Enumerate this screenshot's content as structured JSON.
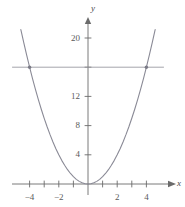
{
  "chart_data": {
    "type": "line",
    "title": "",
    "xlabel": "x",
    "ylabel": "y",
    "xlim": [
      -5.8,
      5.5
    ],
    "ylim": [
      -1.2,
      22.5
    ],
    "grid": false,
    "legend": "none",
    "axis_color": "#6b6b6b",
    "curve_color": "#8a8a96",
    "line_color": "#9a9aa2",
    "marker_color": "#7a7a86",
    "x_ticks": [
      -4,
      -3,
      -2,
      -1,
      0,
      1,
      2,
      3,
      4
    ],
    "x_tick_labels": [
      {
        "value": -4,
        "label": "−4"
      },
      {
        "value": -2,
        "label": "−2"
      },
      {
        "value": 2,
        "label": "2"
      },
      {
        "value": 4,
        "label": "4"
      }
    ],
    "y_ticks": [
      4,
      8,
      12,
      16,
      20
    ],
    "y_tick_labels": [
      {
        "value": 4,
        "label": "4"
      },
      {
        "value": 8,
        "label": "8"
      },
      {
        "value": 12,
        "label": "12"
      },
      {
        "value": 20,
        "label": "20"
      }
    ],
    "series": [
      {
        "name": "parabola",
        "equation": "y = x^2",
        "type": "curve",
        "x": [
          -4.6,
          -4.4,
          -4.2,
          -4.0,
          -3.8,
          -3.6,
          -3.4,
          -3.2,
          -3.0,
          -2.8,
          -2.6,
          -2.4,
          -2.2,
          -2.0,
          -1.8,
          -1.6,
          -1.4,
          -1.2,
          -1.0,
          -0.8,
          -0.6,
          -0.4,
          -0.2,
          0.0,
          0.2,
          0.4,
          0.6,
          0.8,
          1.0,
          1.2,
          1.4,
          1.6,
          1.8,
          2.0,
          2.2,
          2.4,
          2.6,
          2.8,
          3.0,
          3.2,
          3.4,
          3.6,
          3.8,
          4.0,
          4.2,
          4.4,
          4.6
        ],
        "y": [
          21.16,
          19.36,
          17.64,
          16.0,
          14.44,
          12.96,
          11.56,
          10.24,
          9.0,
          7.84,
          6.76,
          5.76,
          4.84,
          4.0,
          3.24,
          2.56,
          1.96,
          1.44,
          1.0,
          0.64,
          0.36,
          0.16,
          0.04,
          0.0,
          0.04,
          0.16,
          0.36,
          0.64,
          1.0,
          1.44,
          1.96,
          2.56,
          3.24,
          4.0,
          4.84,
          5.76,
          6.76,
          7.84,
          9.0,
          10.24,
          11.56,
          12.96,
          14.44,
          16.0,
          17.64,
          19.36,
          21.16
        ]
      },
      {
        "name": "horizontal-line",
        "equation": "y = 16",
        "type": "line",
        "x": [
          -5.2,
          5.2
        ],
        "y": [
          16,
          16
        ]
      }
    ],
    "intersection_points": [
      {
        "x": -4,
        "y": 16
      },
      {
        "x": 4,
        "y": 16
      }
    ]
  }
}
